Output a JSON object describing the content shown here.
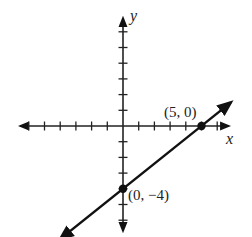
{
  "chart_data": {
    "type": "line",
    "title": "",
    "xlabel": "x",
    "ylabel": "y",
    "xlim": [
      -6,
      6
    ],
    "ylim": [
      -7,
      7
    ],
    "grid": false,
    "ticks": {
      "x": [
        -6,
        -5,
        -4,
        -3,
        -2,
        -1,
        1,
        2,
        3,
        4,
        5,
        6
      ],
      "y": [
        -6,
        -5,
        -4,
        -3,
        -2,
        -1,
        1,
        2,
        3,
        4,
        5,
        6,
        7
      ]
    },
    "tick_labels_shown": false,
    "series": [
      {
        "name": "line",
        "equation": "y = (4/5)x - 4",
        "slope": 0.8,
        "intercept": -4,
        "arrows_both_ends": true,
        "x": [
          -4,
          5,
          7
        ],
        "y": [
          -7.2,
          0,
          1.6
        ]
      }
    ],
    "points": [
      {
        "x": 5,
        "y": 0,
        "label": "(5, 0)"
      },
      {
        "x": 0,
        "y": -4,
        "label": "(0, −4)"
      }
    ]
  },
  "labels": {
    "x_axis": "x",
    "y_axis": "y",
    "point_a": "(5, 0)",
    "point_b": "(0, −4)"
  }
}
